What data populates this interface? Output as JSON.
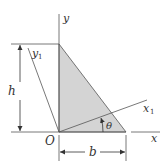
{
  "diagram": {
    "type": "geometry-figure",
    "colors": {
      "line": "#4a4a4a",
      "fill": "#d4d4d4",
      "background": "#ffffff",
      "text": "#333333"
    },
    "labels": {
      "y_axis": "y",
      "x_axis": "x",
      "y1_axis": "y",
      "y1_sub": "1",
      "x1_axis": "x",
      "x1_sub": "1",
      "origin": "O",
      "height": "h",
      "base": "b",
      "angle": "θ"
    }
  }
}
